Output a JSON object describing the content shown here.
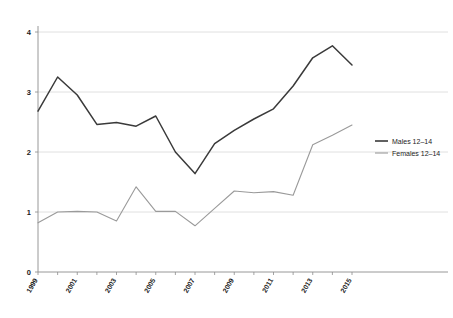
{
  "chart_data": {
    "type": "line",
    "title": "",
    "subtitle": "",
    "xlabel": "",
    "ylabel": "",
    "xlim": [
      1999,
      2015
    ],
    "ylim": [
      0,
      4
    ],
    "grid": "horizontal",
    "legend_position": "right",
    "x": [
      1999,
      2000,
      2001,
      2002,
      2003,
      2004,
      2005,
      2006,
      2007,
      2008,
      2009,
      2010,
      2011,
      2012,
      2013,
      2014,
      2015
    ],
    "x_tick_labels": [
      "1999",
      "",
      "2001",
      "",
      "2003",
      "",
      "2005",
      "",
      "2007",
      "",
      "2009",
      "",
      "2011",
      "",
      "2013",
      "",
      "2015"
    ],
    "x_tick_labels_visible": [
      "1999",
      "2001",
      "2003",
      "2005",
      "2007",
      "2009",
      "2011",
      "2013",
      "2015"
    ],
    "y_tick_labels": [
      "0",
      "1",
      "2",
      "3",
      "4"
    ],
    "y_ticks": [
      0,
      1,
      2,
      3,
      4
    ],
    "series": [
      {
        "name": "Males 12–14",
        "color": "#3a3a3a",
        "values": [
          2.68,
          3.25,
          2.95,
          2.46,
          2.49,
          2.43,
          2.6,
          2.0,
          1.64,
          2.14,
          2.36,
          2.55,
          2.72,
          3.1,
          3.57,
          3.77,
          3.45
        ]
      },
      {
        "name": "Females 12–14",
        "color": "#9a9a9a",
        "values": [
          0.82,
          1.0,
          1.01,
          1.0,
          0.85,
          1.42,
          1.01,
          1.01,
          0.77,
          1.06,
          1.35,
          1.32,
          1.34,
          1.28,
          2.12,
          2.28,
          2.45
        ]
      }
    ]
  },
  "legend": {
    "entries": [
      {
        "label": "Males 12–14",
        "color": "#3a3a3a"
      },
      {
        "label": "Females 12–14",
        "color": "#9a9a9a"
      }
    ]
  },
  "axes": {
    "y_tick_0": "0",
    "y_tick_1": "1",
    "y_tick_2": "2",
    "y_tick_3": "3",
    "y_tick_4": "4"
  },
  "colors": {
    "males": "#3a3a3a",
    "females": "#9a9a9a",
    "grid": "#d8d8d8",
    "axis": "#8c8c8c",
    "text": "#1c1c1c",
    "background": "#ffffff"
  }
}
